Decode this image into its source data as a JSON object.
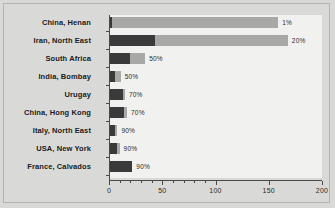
{
  "chart_data": {
    "type": "bar",
    "orientation": "horizontal",
    "stacked": true,
    "title": "",
    "xlabel": "",
    "ylabel": "",
    "xlim": [
      0,
      200
    ],
    "xticks": [
      0,
      50,
      100,
      150,
      200
    ],
    "xtick_labels": [
      "0",
      "50",
      "100",
      "150",
      "200"
    ],
    "minor_xticks": [
      10,
      20,
      30,
      40,
      60,
      70,
      80,
      90
    ],
    "grid": false,
    "legend": "none",
    "categories": [
      "China, Henan",
      "Iran, North East",
      "South Africa",
      "India, Bombay",
      "Urugay",
      "China, Hong Kong",
      "Italy, North East",
      "USA, New York",
      "France, Calvados"
    ],
    "series": [
      {
        "name": "dark-segment",
        "color": "#3a3a3a",
        "values": [
          2,
          42,
          19,
          5,
          12,
          13,
          5,
          7,
          21
        ]
      },
      {
        "name": "light-segment",
        "color": "#a8a8a6",
        "values": [
          156,
          125,
          14,
          5,
          2,
          3,
          2,
          2,
          0
        ]
      }
    ],
    "totals": [
      158,
      167,
      33,
      10,
      14,
      16,
      7,
      9,
      21
    ],
    "data_labels": [
      "1%",
      "20%",
      "50%",
      "50%",
      "70%",
      "70%",
      "90%",
      "90%",
      "90%"
    ]
  },
  "colors": {
    "page_background": "#d9d9d7",
    "plot_background": "#f1f1ef",
    "axis": "#4a4a4a",
    "dark_segment": "#3a3a3a",
    "light_segment": "#a8a8a6",
    "label_text": "#1a1a1a"
  }
}
